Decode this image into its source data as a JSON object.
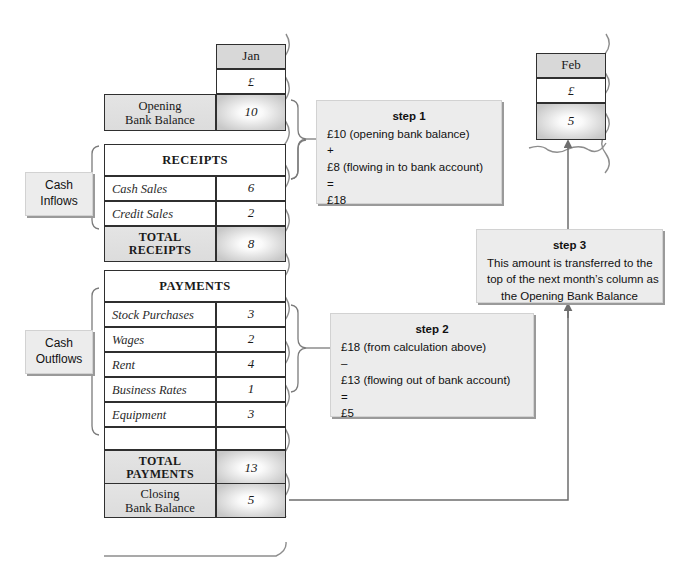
{
  "diagram": {
    "month_columns": [
      {
        "name": "jan",
        "label": "Jan",
        "currency": "£"
      },
      {
        "name": "feb",
        "label": "Feb",
        "currency": "£"
      }
    ],
    "side_labels": [
      {
        "name": "cash-inflows",
        "label": "Cash\nInflows"
      },
      {
        "name": "cash-outflows",
        "label": "Cash\nOutflows"
      }
    ],
    "rows": {
      "opening_bank_balance": {
        "label": "Opening\nBank Balance",
        "value": "10"
      },
      "receipts_heading": "RECEIPTS",
      "receipts": [
        {
          "label": "Cash Sales",
          "value": "6"
        },
        {
          "label": "Credit Sales",
          "value": "2"
        }
      ],
      "total_receipts": {
        "label": "TOTAL\nRECEIPTS",
        "value": "8"
      },
      "payments_heading": "PAYMENTS",
      "payments": [
        {
          "label": "Stock Purchases",
          "value": "3"
        },
        {
          "label": "Wages",
          "value": "2"
        },
        {
          "label": "Rent",
          "value": "4"
        },
        {
          "label": "Business Rates",
          "value": "1"
        },
        {
          "label": "Equipment",
          "value": "3"
        },
        {
          "label": "",
          "value": ""
        }
      ],
      "total_payments": {
        "label": "TOTAL\nPAYMENTS",
        "value": "13"
      },
      "closing_bank_balance": {
        "label": "Closing\nBank Balance",
        "value": "5"
      }
    },
    "feb_opening_value": "5",
    "steps": [
      {
        "name": "step-1",
        "title": "step 1",
        "lines": [
          "£10 (opening bank balance)",
          "+",
          "£8 (flowing in to bank account)",
          "=",
          "£18"
        ]
      },
      {
        "name": "step-2",
        "title": "step 2",
        "lines": [
          "£18 (from calculation above)",
          "–",
          "£13 (flowing out of bank account)",
          "=",
          "£5"
        ]
      },
      {
        "name": "step-3",
        "title": "step 3",
        "lines": [
          "This amount is transferred to the",
          "top of the next month’s column as",
          "the Opening Bank Balance"
        ]
      }
    ],
    "colors": {
      "shade": "#d8d8d8",
      "note_bg": "#ececec",
      "note_shadow": "#9a9a9a",
      "rule": "#2f2f2f",
      "arrow": "#6e6e6e"
    }
  }
}
